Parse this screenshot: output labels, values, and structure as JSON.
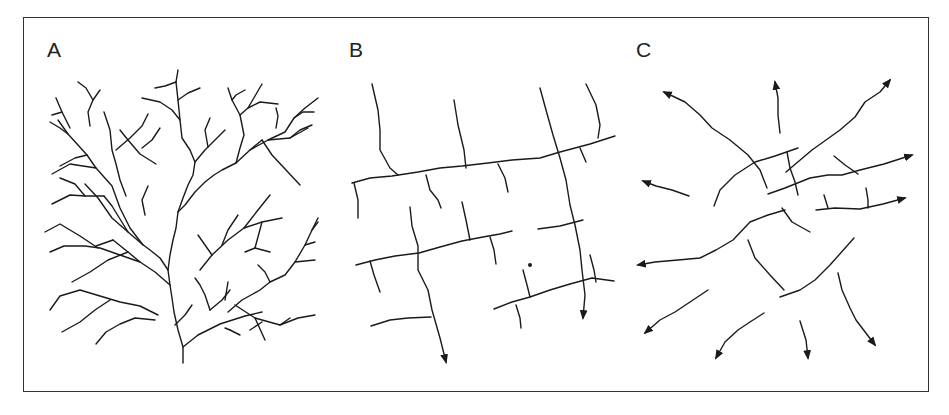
{
  "figure": {
    "panels": [
      {
        "label": "A",
        "pattern": "dendritic"
      },
      {
        "label": "B",
        "pattern": "trellis"
      },
      {
        "label": "C",
        "pattern": "radial"
      }
    ]
  },
  "colors": {
    "line": "#1a1a1a",
    "background": "#ffffff",
    "frame": "#333333"
  }
}
